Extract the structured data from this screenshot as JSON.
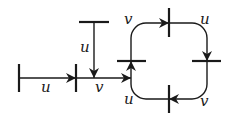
{
  "diagram": {
    "labels": {
      "left_edge": "u",
      "vertical_edge": "u",
      "middle_edge": "v",
      "loop_top_left": "v",
      "loop_top_right": "u",
      "loop_bottom_left": "u",
      "loop_bottom_right": "v"
    },
    "colors": {
      "stroke": "#1a1a1a",
      "background": "#ffffff"
    }
  }
}
